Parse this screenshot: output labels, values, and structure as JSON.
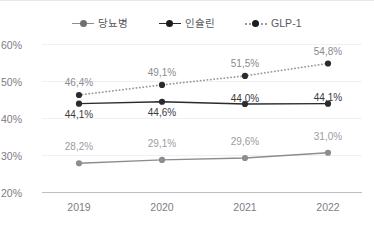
{
  "legend": {
    "items": [
      {
        "label": "당뇨병",
        "key": "diabetes",
        "marker": "line-marker-gray-solid",
        "color": "#8c8c91",
        "style": "solid"
      },
      {
        "label": "인슐린",
        "key": "insulin",
        "marker": "line-marker-dark-solid",
        "color": "#2b2b2f",
        "style": "solid"
      },
      {
        "label": "GLP-1",
        "key": "glp1",
        "marker": "line-marker-gray-dotted",
        "color": "#9a9aa0",
        "style": "dotted"
      }
    ]
  },
  "axes": {
    "y_ticks": [
      "60%",
      "50%",
      "40%",
      "30%",
      "20%"
    ],
    "x_ticks": [
      "2019",
      "2020",
      "2021",
      "2022"
    ]
  },
  "labels": {
    "glp1": [
      "46,4%",
      "49,1%",
      "51,5%",
      "54,8%"
    ],
    "insulin": [
      "44,1%",
      "44,6%",
      "44,0%",
      "44,1%"
    ],
    "diabetes": [
      "28,2%",
      "29,1%",
      "29,6%",
      "31,0%"
    ]
  },
  "chart_data": {
    "type": "line",
    "title": "",
    "subtitle": "",
    "xlabel": "",
    "ylabel": "",
    "categories": [
      "2019",
      "2020",
      "2021",
      "2022"
    ],
    "ylim": [
      20,
      60
    ],
    "y_tick_values": [
      60,
      50,
      40,
      30,
      20
    ],
    "y_tick_labels": [
      "60%",
      "50%",
      "40%",
      "30%",
      "20%"
    ],
    "grid": true,
    "grid_axis": "y",
    "legend_position": "top-center",
    "decimal_separator": ",",
    "unit": "%",
    "series": [
      {
        "name": "당뇨병",
        "values": [
          28.2,
          29.1,
          29.6,
          31.0
        ],
        "data_labels": [
          "28,2%",
          "29,1%",
          "29,6%",
          "31,0%"
        ],
        "color": "#8c8c91",
        "line_style": "solid",
        "marker": "circle",
        "label_position": "above"
      },
      {
        "name": "인슐린",
        "values": [
          44.1,
          44.6,
          44.0,
          44.1
        ],
        "data_labels": [
          "44,1%",
          "44,6%",
          "44,0%",
          "44,1%"
        ],
        "color": "#2b2b2f",
        "line_style": "solid",
        "marker": "circle",
        "label_position": "below-then-above"
      },
      {
        "name": "GLP-1",
        "values": [
          46.4,
          49.1,
          51.5,
          54.8
        ],
        "data_labels": [
          "46,4%",
          "49,1%",
          "51,5%",
          "54,8%"
        ],
        "color": "#9a9aa0",
        "line_style": "dotted",
        "marker": "circle",
        "label_position": "above"
      }
    ]
  }
}
